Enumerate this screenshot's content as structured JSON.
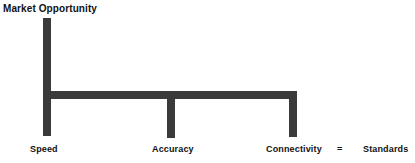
{
  "diagram": {
    "title": "Market Opportunity",
    "type": "bracket-tree",
    "colors": {
      "background": "#ffffff",
      "bar": "#3a3a3a",
      "text": "#111111"
    },
    "stem": {
      "name": "market-opportunity-stem"
    },
    "branches": [
      {
        "id": "speed",
        "label": "Speed"
      },
      {
        "id": "accuracy",
        "label": "Accuracy"
      },
      {
        "id": "connectivity",
        "label": "Connectivity"
      }
    ],
    "equation": {
      "operator": "=",
      "result": "Standards"
    }
  }
}
